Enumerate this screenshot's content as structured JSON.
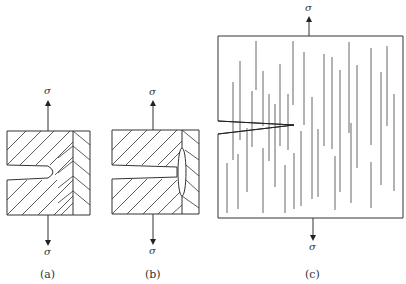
{
  "figure": {
    "panels": [
      {
        "id": "a",
        "caption": "(a)",
        "stress_top": "σ",
        "stress_bottom": "σ",
        "description": "Notched specimen with crack tip blunted in ductile region"
      },
      {
        "id": "b",
        "caption": "(b)",
        "stress_top": "σ",
        "stress_bottom": "σ",
        "description": "Notched specimen with crack deflected along interface"
      },
      {
        "id": "c",
        "caption": "(c)",
        "stress_top": "σ",
        "stress_bottom": "σ",
        "description": "Notched specimen with aligned fibers/cracks"
      }
    ]
  }
}
